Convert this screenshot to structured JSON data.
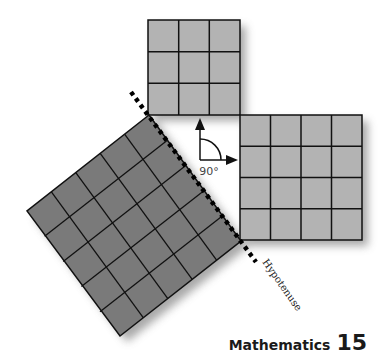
{
  "figure": {
    "colors": {
      "small_square_fill": "#b3b3b3",
      "large_square_fill": "#7a7a7a",
      "grid_line": "#111111",
      "shadow": "#9a9a9a",
      "hypotenuse_dots": "#000000"
    },
    "squares": [
      {
        "id": "top-square",
        "grid": 3,
        "label": "3 x 3"
      },
      {
        "id": "right-square",
        "grid": 4,
        "label": "4 x 4"
      },
      {
        "id": "hypotenuse-square",
        "grid": 5,
        "label": "5 x 5"
      }
    ],
    "angle_label": "90°",
    "hypotenuse_label": "Hypotenuse"
  },
  "footer": {
    "book_title": "Mathematics",
    "page_number": "15"
  }
}
